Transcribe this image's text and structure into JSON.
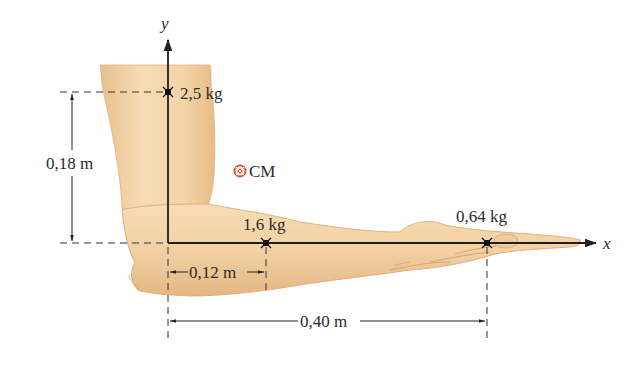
{
  "figure": {
    "axes": {
      "x_label": "x",
      "y_label": "y",
      "origin": "elbow"
    },
    "masses": [
      {
        "id": "upper-arm",
        "label": "2,5 kg",
        "x_m": 0,
        "y_m": 0.18
      },
      {
        "id": "forearm",
        "label": "1,6 kg",
        "x_m": 0.12,
        "y_m": 0
      },
      {
        "id": "hand",
        "label": "0,64 kg",
        "x_m": 0.4,
        "y_m": 0
      }
    ],
    "center_of_mass": {
      "label": "CM",
      "color": "#e4572e"
    },
    "dimensions": [
      {
        "id": "upper-arm-height",
        "label": "0,18 m"
      },
      {
        "id": "forearm-distance",
        "label": "0,12 m"
      },
      {
        "id": "hand-distance",
        "label": "0,40 m"
      }
    ],
    "colors": {
      "skin": "#f3d3a6",
      "skin_shadow": "#e2b581",
      "skin_outline": "#d9a874",
      "line": "#222222",
      "cm_marker": "#e4572e"
    }
  }
}
